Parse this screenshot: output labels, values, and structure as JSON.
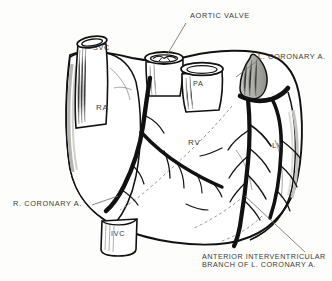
{
  "figure": {
    "title_text": "",
    "background_color": "#fdfdfb",
    "ink_color": "#111111",
    "text_color": "#3a3a38",
    "view": "anterior surface of the heart with coronary arteries"
  },
  "labels": {
    "aortic_valve": "AORTIC  VALVE",
    "left_coronary": "L. CORONARY A.",
    "right_coronary": "R. CORONARY A.",
    "anterior_iv_line1": "ANTERIOR INTERVENTRICULAR",
    "anterior_iv_line2": "BRANCH  OF  L. CORONARY A.",
    "svc": "SVC",
    "ivc": "IVC",
    "pa": "PA",
    "ra": "RA",
    "rv": "RV",
    "lv": "LV"
  }
}
